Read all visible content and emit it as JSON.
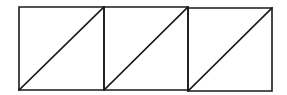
{
  "diagram": {
    "stroke_color": "#1a1a1a",
    "background_color": "#ffffff",
    "stroke_width": 1.6,
    "outer_rect": {
      "x1": 19,
      "y1": 7,
      "x2": 272,
      "y2": 90
    },
    "cells": [
      {
        "x1": 19,
        "y1": 7,
        "x2": 104,
        "y2": 90,
        "diagonal": "bottom-left-to-top-right"
      },
      {
        "x1": 104,
        "y1": 7,
        "x2": 188,
        "y2": 90,
        "diagonal": "bottom-left-to-top-right"
      },
      {
        "x1": 188,
        "y1": 8,
        "x2": 272,
        "y2": 91,
        "diagonal": "bottom-left-to-top-right"
      }
    ]
  }
}
